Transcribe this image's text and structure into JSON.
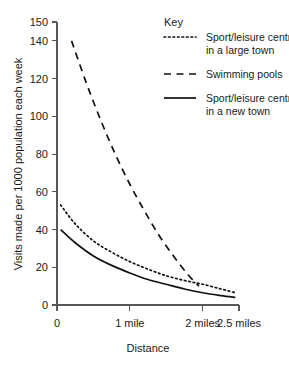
{
  "chart_data": {
    "type": "line",
    "title": "",
    "xlabel": "Distance",
    "ylabel": "Visits made per 1000 population each week",
    "xlim": [
      0,
      2.5
    ],
    "ylim": [
      0,
      150
    ],
    "grid": false,
    "legend_position": "top-right",
    "legend_title": "Key",
    "x_ticks": [
      {
        "value": 0,
        "label": "0"
      },
      {
        "value": 1,
        "label": "1 mile"
      },
      {
        "value": 2,
        "label": "2 miles"
      },
      {
        "value": 2.5,
        "label": "2.5 miles"
      }
    ],
    "y_ticks": [
      {
        "value": 0,
        "label": "0"
      },
      {
        "value": 20,
        "label": "20"
      },
      {
        "value": 40,
        "label": "40"
      },
      {
        "value": 60,
        "label": "60"
      },
      {
        "value": 80,
        "label": "80"
      },
      {
        "value": 100,
        "label": "100"
      },
      {
        "value": 120,
        "label": "120"
      },
      {
        "value": 140,
        "label": "140"
      },
      {
        "value": 150,
        "label": "150"
      }
    ],
    "series": [
      {
        "name": "Sport/leisure centre in a large town",
        "style": "dotted",
        "color": "#111111",
        "x": [
          0.05,
          0.25,
          0.5,
          0.75,
          1.0,
          1.25,
          1.5,
          1.75,
          2.0,
          2.25,
          2.45
        ],
        "y": [
          53,
          43,
          34,
          28,
          23,
          19,
          15.5,
          13,
          11,
          8.5,
          6.5
        ]
      },
      {
        "name": "Swimming pools",
        "style": "dashed",
        "color": "#111111",
        "x": [
          0.2,
          0.4,
          0.6,
          0.8,
          1.0,
          1.2,
          1.4,
          1.6,
          1.8,
          1.95
        ],
        "y": [
          140,
          118,
          98,
          80,
          64,
          50,
          37,
          26,
          16,
          10
        ]
      },
      {
        "name": "Sport/leisure centre in a new town",
        "style": "solid",
        "color": "#111111",
        "x": [
          0.05,
          0.25,
          0.5,
          0.75,
          1.0,
          1.25,
          1.5,
          1.75,
          2.0,
          2.25,
          2.45
        ],
        "y": [
          40,
          33,
          26,
          21,
          17,
          13.5,
          11,
          8.5,
          6.5,
          5,
          4
        ]
      }
    ],
    "legend_entries": [
      {
        "line1": "Sport/leisure centre",
        "line2": "in a large town",
        "style": "dotted"
      },
      {
        "line1": "Swimming pools",
        "line2": "",
        "style": "dashed"
      },
      {
        "line1": "Sport/leisure centre",
        "line2": "in a new town",
        "style": "solid"
      }
    ]
  }
}
